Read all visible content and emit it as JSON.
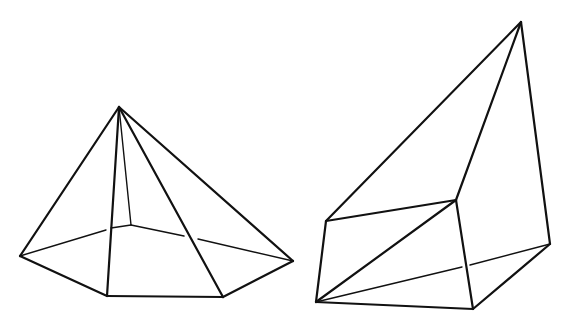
{
  "diagram": {
    "stroke_color": "#111111",
    "background": "#ffffff",
    "visible_edge_width": 2.2,
    "hidden_edge_width": 1.4,
    "shapes": [
      {
        "name": "pentagonal-pyramid",
        "apex": [
          119,
          107
        ],
        "base": [
          [
            20,
            256
          ],
          [
            107,
            296
          ],
          [
            223,
            297
          ],
          [
            293,
            261
          ],
          [
            131,
            225
          ]
        ],
        "visible_edges": [
          [
            [
              119,
              107
            ],
            [
              20,
              256
            ]
          ],
          [
            [
              119,
              107
            ],
            [
              107,
              296
            ]
          ],
          [
            [
              119,
              107
            ],
            [
              223,
              297
            ]
          ],
          [
            [
              119,
              107
            ],
            [
              293,
              261
            ]
          ],
          [
            [
              20,
              256
            ],
            [
              107,
              296
            ]
          ],
          [
            [
              107,
              296
            ],
            [
              223,
              297
            ]
          ],
          [
            [
              223,
              297
            ],
            [
              293,
              261
            ]
          ]
        ],
        "thin_edges": [
          [
            [
              119,
              107
            ],
            [
              131,
              225
            ]
          ],
          [
            [
              20,
              256
            ],
            [
              106,
              230
            ]
          ],
          [
            [
              111,
              228
            ],
            [
              131,
              225
            ]
          ],
          [
            [
              131,
              225
            ],
            [
              184,
              236
            ]
          ],
          [
            [
              198,
              239
            ],
            [
              293,
              261
            ]
          ]
        ]
      },
      {
        "name": "wedge-solid",
        "vertices": {
          "apex": [
            521,
            22
          ],
          "front_top_left": [
            326,
            221
          ],
          "front_top_right": [
            456,
            200
          ],
          "front_bottom_right": [
            473,
            309
          ],
          "front_bottom_left": [
            316,
            302
          ],
          "back_right": [
            550,
            244
          ]
        },
        "visible_edges": [
          [
            [
              521,
              22
            ],
            [
              326,
              221
            ]
          ],
          [
            [
              521,
              22
            ],
            [
              456,
              200
            ]
          ],
          [
            [
              521,
              22
            ],
            [
              550,
              244
            ]
          ],
          [
            [
              326,
              221
            ],
            [
              456,
              200
            ]
          ],
          [
            [
              456,
              200
            ],
            [
              473,
              309
            ]
          ],
          [
            [
              473,
              309
            ],
            [
              316,
              302
            ]
          ],
          [
            [
              316,
              302
            ],
            [
              326,
              221
            ]
          ],
          [
            [
              316,
              302
            ],
            [
              456,
              200
            ]
          ],
          [
            [
              473,
              309
            ],
            [
              550,
              244
            ]
          ]
        ],
        "thin_edges": [
          [
            [
              316,
              302
            ],
            [
              462,
              267
            ]
          ],
          [
            [
              470,
              265
            ],
            [
              550,
              244
            ]
          ]
        ]
      }
    ]
  }
}
